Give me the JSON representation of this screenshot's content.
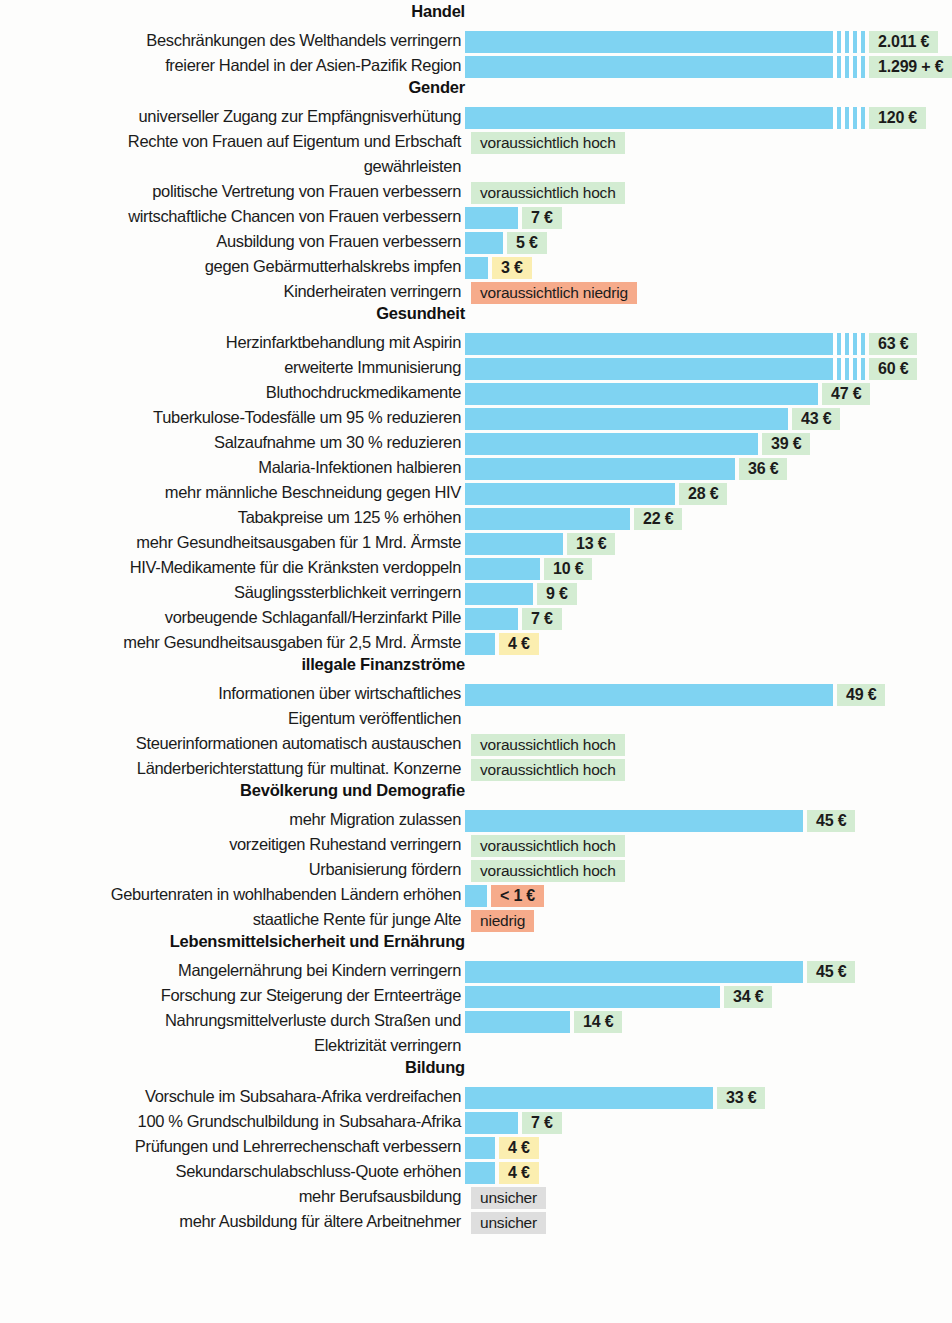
{
  "chart_data": {
    "type": "bar",
    "title": "",
    "xlabel": "",
    "ylabel": "",
    "unit": "€",
    "orientation": "horizontal",
    "grid": false,
    "legend": false,
    "note": "Nutzen pro ausgegebenem Euro, gruppiert nach Themenbereich. Balken sind linear skaliert (ca. 7,5 px je Euro); sehr lange Balken sind mit einem Achsenbruch (Streifenmuster) abgeschnitten.",
    "value_axis_px_per_unit": 7.5,
    "bar_origin_px": 465,
    "colors": {
      "bar": "#7fd3f2",
      "badge_high": "#d3ecd2",
      "badge_medium": "#fbeeb0",
      "badge_low": "#f6ab8b",
      "badge_unknown": "#dedede",
      "text": "#1b1b1b",
      "background": "#fdfdfc"
    },
    "badge_legend": [
      {
        "key": "high",
        "color": "#d3ecd2",
        "meaning": "hoher Nutzen"
      },
      {
        "key": "medium",
        "color": "#fbeeb0",
        "meaning": "mittlerer Nutzen"
      },
      {
        "key": "low",
        "color": "#f6ab8b",
        "meaning": "niedriger Nutzen"
      },
      {
        "key": "unknown",
        "color": "#dedede",
        "meaning": "unsicher"
      }
    ],
    "sections": [
      {
        "name": "Handel",
        "items": [
          {
            "label": "Beschränkungen des Welthandels verringern",
            "value": 2011,
            "value_text": "2.011 €",
            "badge": "high",
            "truncated": true
          },
          {
            "label": "freierer Handel in der Asien-Pazifik Region",
            "value": 1299,
            "value_text": "1.299 + €",
            "badge": "high",
            "truncated": true
          }
        ]
      },
      {
        "name": "Gender",
        "items": [
          {
            "label": "universeller Zugang zur Empfängnisverhütung",
            "value": 120,
            "value_text": "120 €",
            "badge": "high",
            "truncated": true
          },
          {
            "label": "Rechte von Frauen auf Eigentum und Erbschaft\ngewährleisten",
            "value": null,
            "value_text": "voraussichtlich hoch",
            "badge": "high",
            "truncated": false
          },
          {
            "label": "politische Vertretung von Frauen verbessern",
            "value": null,
            "value_text": "voraussichtlich hoch",
            "badge": "high",
            "truncated": false
          },
          {
            "label": "wirtschaftliche Chancen von Frauen verbessern",
            "value": 7,
            "value_text": "7 €",
            "badge": "high",
            "truncated": false
          },
          {
            "label": "Ausbildung von Frauen verbessern",
            "value": 5,
            "value_text": "5 €",
            "badge": "high",
            "truncated": false
          },
          {
            "label": "gegen Gebärmutterhalskrebs impfen",
            "value": 3,
            "value_text": "3 €",
            "badge": "medium",
            "truncated": false
          },
          {
            "label": "Kinderheiraten verringern",
            "value": null,
            "value_text": "voraussichtlich niedrig",
            "badge": "low",
            "truncated": false
          }
        ]
      },
      {
        "name": "Gesundheit",
        "items": [
          {
            "label": "Herzinfarktbehandlung mit Aspirin",
            "value": 63,
            "value_text": "63 €",
            "badge": "high",
            "truncated": true
          },
          {
            "label": "erweiterte Immunisierung",
            "value": 60,
            "value_text": "60 €",
            "badge": "high",
            "truncated": true
          },
          {
            "label": "Bluthochdruckmedikamente",
            "value": 47,
            "value_text": "47 €",
            "badge": "high",
            "truncated": false
          },
          {
            "label": "Tuberkulose-Todesfälle um 95 % reduzieren",
            "value": 43,
            "value_text": "43 €",
            "badge": "high",
            "truncated": false
          },
          {
            "label": "Salzaufnahme um 30 % reduzieren",
            "value": 39,
            "value_text": "39 €",
            "badge": "high",
            "truncated": false
          },
          {
            "label": "Malaria-Infektionen halbieren",
            "value": 36,
            "value_text": "36 €",
            "badge": "high",
            "truncated": false
          },
          {
            "label": "mehr männliche Beschneidung gegen HIV",
            "value": 28,
            "value_text": "28 €",
            "badge": "high",
            "truncated": false
          },
          {
            "label": "Tabakpreise um 125 % erhöhen",
            "value": 22,
            "value_text": "22 €",
            "badge": "high",
            "truncated": false
          },
          {
            "label": "mehr Gesundheitsausgaben für 1 Mrd. Ärmste",
            "value": 13,
            "value_text": "13 €",
            "badge": "high",
            "truncated": false
          },
          {
            "label": "HIV-Medikamente für die Kränksten verdoppeln",
            "value": 10,
            "value_text": "10 €",
            "badge": "high",
            "truncated": false
          },
          {
            "label": "Säuglingssterblichkeit verringern",
            "value": 9,
            "value_text": "9 €",
            "badge": "high",
            "truncated": false
          },
          {
            "label": "vorbeugende Schlaganfall/Herzinfarkt Pille",
            "value": 7,
            "value_text": "7 €",
            "badge": "high",
            "truncated": false
          },
          {
            "label": "mehr Gesundheitsausgaben für 2,5 Mrd. Ärmste",
            "value": 4,
            "value_text": "4 €",
            "badge": "medium",
            "truncated": false
          }
        ]
      },
      {
        "name": "illegale Finanzströme",
        "items": [
          {
            "label": "Informationen über wirtschaftliches\nEigentum veröffentlichen",
            "value": 49,
            "value_text": "49 €",
            "badge": "high",
            "truncated": false
          },
          {
            "label": "Steuerinformationen automatisch austauschen",
            "value": null,
            "value_text": "voraussichtlich hoch",
            "badge": "high",
            "truncated": false
          },
          {
            "label": "Länderberichterstattung für multinat. Konzerne",
            "value": null,
            "value_text": "voraussichtlich hoch",
            "badge": "high",
            "truncated": false
          }
        ]
      },
      {
        "name": "Bevölkerung und Demografie",
        "items": [
          {
            "label": "mehr Migration zulassen",
            "value": 45,
            "value_text": "45 €",
            "badge": "high",
            "truncated": false
          },
          {
            "label": "vorzeitigen Ruhestand verringern",
            "value": null,
            "value_text": "voraussichtlich hoch",
            "badge": "high",
            "truncated": false
          },
          {
            "label": "Urbanisierung fördern",
            "value": null,
            "value_text": "voraussichtlich hoch",
            "badge": "high",
            "truncated": false
          },
          {
            "label": "Geburtenraten in wohlhabenden Ländern erhöhen",
            "value": 1,
            "value_text": "< 1 €",
            "badge": "low",
            "truncated": false
          },
          {
            "label": "staatliche Rente für junge Alte",
            "value": null,
            "value_text": "niedrig",
            "badge": "low",
            "truncated": false
          }
        ]
      },
      {
        "name": "Lebensmittelsicherheit und Ernährung",
        "items": [
          {
            "label": "Mangelernährung bei Kindern verringern",
            "value": 45,
            "value_text": "45 €",
            "badge": "high",
            "truncated": false
          },
          {
            "label": "Forschung zur Steigerung der Ernteerträge",
            "value": 34,
            "value_text": "34 €",
            "badge": "high",
            "truncated": false
          },
          {
            "label": "Nahrungsmittelverluste durch Straßen und\nElektrizität verringern",
            "value": 14,
            "value_text": "14 €",
            "badge": "high",
            "truncated": false
          }
        ]
      },
      {
        "name": "Bildung",
        "items": [
          {
            "label": "Vorschule im Subsahara-Afrika verdreifachen",
            "value": 33,
            "value_text": "33 €",
            "badge": "high",
            "truncated": false
          },
          {
            "label": "100 % Grundschulbildung in Subsahara-Afrika",
            "value": 7,
            "value_text": "7 €",
            "badge": "high",
            "truncated": false
          },
          {
            "label": "Prüfungen und Lehrerrechenschaft verbessern",
            "value": 4,
            "value_text": "4 €",
            "badge": "medium",
            "truncated": false
          },
          {
            "label": "Sekundarschulabschluss-Quote erhöhen",
            "value": 4,
            "value_text": "4 €",
            "badge": "medium",
            "truncated": false
          },
          {
            "label": "mehr Berufsausbildung",
            "value": null,
            "value_text": "unsicher",
            "badge": "unknown",
            "truncated": false
          },
          {
            "label": "mehr Ausbildung für ältere Arbeitnehmer",
            "value": null,
            "value_text": "unsicher",
            "badge": "unknown",
            "truncated": false
          }
        ]
      }
    ]
  }
}
